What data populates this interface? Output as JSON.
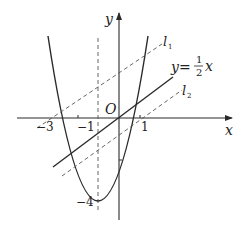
{
  "diagram": {
    "type": "function-graph",
    "axes": {
      "x_label": "x",
      "y_label": "y",
      "origin_label": "O"
    },
    "x_ticks": [
      "−3",
      "−1",
      "1"
    ],
    "y_ticks": [
      "−4"
    ],
    "curves": [
      {
        "name": "parabola",
        "equation": "y = x² + 2x − 3",
        "vertex": [
          -1,
          -4
        ],
        "roots": [
          -3,
          1
        ]
      },
      {
        "name": "line",
        "label_prefix": "y=",
        "label_num": "1",
        "label_den": "2",
        "label_var": "x"
      },
      {
        "name": "l1",
        "label_main": "l",
        "label_sub": "1"
      },
      {
        "name": "l2",
        "label_main": "l",
        "label_sub": "2"
      }
    ],
    "guides": [
      {
        "name": "axis-of-symmetry",
        "x": -1,
        "style": "dashed"
      }
    ],
    "colors": {
      "stroke": "#2a2a2a",
      "dashed": "#555555",
      "background": "#ffffff"
    }
  }
}
